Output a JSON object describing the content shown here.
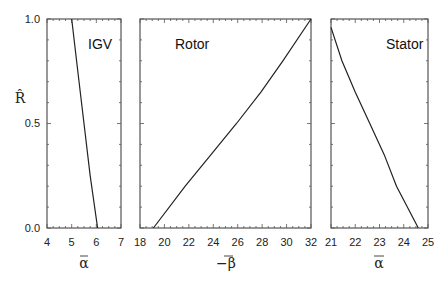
{
  "chart_data": [
    {
      "type": "line",
      "title": "IGV",
      "xlabel": "ᾱ",
      "ylabel": "R̂",
      "xlim": [
        4,
        7
      ],
      "ylim": [
        0.0,
        1.0
      ],
      "xticks": [
        "4",
        "5",
        "6",
        "7"
      ],
      "yticks": [
        "0.0",
        "0.5",
        "1.0"
      ],
      "grid": false,
      "series": [
        {
          "name": "IGV",
          "x": [
            6.05,
            5.75,
            5.5,
            5.25,
            5.0
          ],
          "y": [
            0.0,
            0.25,
            0.5,
            0.75,
            1.0
          ]
        }
      ]
    },
    {
      "type": "line",
      "title": "Rotor",
      "xlabel": "−β̄",
      "ylabel": "R̂",
      "xlim": [
        18,
        32
      ],
      "ylim": [
        0.0,
        1.0
      ],
      "xticks": [
        "18",
        "20",
        "22",
        "24",
        "26",
        "28",
        "30",
        "32"
      ],
      "grid": false,
      "series": [
        {
          "name": "Rotor",
          "x": [
            19.1,
            21.7,
            23.8,
            25.9,
            27.9,
            29.7,
            32.0
          ],
          "y": [
            0.0,
            0.2,
            0.35,
            0.5,
            0.65,
            0.8,
            1.0
          ]
        }
      ]
    },
    {
      "type": "line",
      "title": "Stator",
      "xlabel": "ᾱ",
      "ylabel": "R̂",
      "xlim": [
        21,
        25
      ],
      "ylim": [
        0.0,
        1.0
      ],
      "xticks": [
        "21",
        "22",
        "23",
        "24",
        "25"
      ],
      "grid": false,
      "series": [
        {
          "name": "Stator",
          "x": [
            21.0,
            21.45,
            22.0,
            22.6,
            23.2,
            23.7,
            24.6
          ],
          "y": [
            0.96,
            0.8,
            0.65,
            0.5,
            0.35,
            0.2,
            0.0
          ]
        }
      ]
    }
  ],
  "labels": {
    "ylabel": "R̂",
    "ytick_0": "0.0",
    "ytick_05": "0.5",
    "ytick_1": "1.0",
    "igv": {
      "title": "IGV",
      "xlabel_sym": "α",
      "ticks": [
        "4",
        "5",
        "6",
        "7"
      ]
    },
    "rotor": {
      "title": "Rotor",
      "xlabel_sym": "−β",
      "ticks": [
        "18",
        "20",
        "22",
        "24",
        "26",
        "28",
        "30",
        "32"
      ]
    },
    "stator": {
      "title": "Stator",
      "xlabel_sym": "α",
      "ticks": [
        "21",
        "22",
        "23",
        "24",
        "25"
      ]
    }
  }
}
